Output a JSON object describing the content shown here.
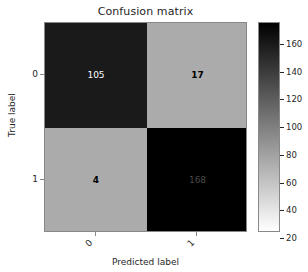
{
  "chart_data": {
    "type": "heatmap",
    "title": "Confusion matrix",
    "xlabel": "Predicted label",
    "ylabel": "True label",
    "x_tick_labels": [
      "0",
      "1"
    ],
    "y_tick_labels": [
      "0",
      "1"
    ],
    "row_labels": [
      "0",
      "1"
    ],
    "col_labels": [
      "0",
      "1"
    ],
    "matrix": [
      [
        105,
        17
      ],
      [
        4,
        168
      ]
    ],
    "cells": [
      {
        "row": "0",
        "col": "0",
        "value": "105",
        "fill": "#1a1a1a",
        "text_color": "#ffffff"
      },
      {
        "row": "0",
        "col": "1",
        "value": "17",
        "fill": "#ababab",
        "text_color": "#000000"
      },
      {
        "row": "1",
        "col": "0",
        "value": "4",
        "fill": "#ababab",
        "text_color": "#000000"
      },
      {
        "row": "1",
        "col": "1",
        "value": "168",
        "fill": "#000000",
        "text_color": "#4a4a4a"
      }
    ],
    "colormap": "gray_reversed",
    "colorbar": {
      "ticks": [
        "160",
        "140",
        "120",
        "100",
        "80",
        "60",
        "40",
        "20"
      ],
      "tick_positions_pct": [
        10.5,
        23.7,
        36.9,
        50.1,
        63.3,
        76.5,
        89.7,
        102.9
      ],
      "vmin": 4,
      "vmax": 168,
      "orientation": "vertical",
      "top_color": "#000000",
      "bottom_color": "#ffffff"
    },
    "grid": false,
    "legend": "none"
  }
}
